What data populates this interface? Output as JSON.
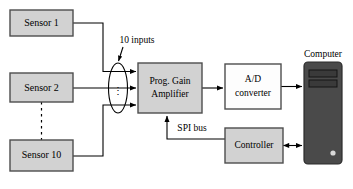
{
  "diagram": {
    "colors": {
      "box_fill_gray": "#d2d2d2",
      "box_fill_white": "#fdfdfd",
      "box_stroke": "#4d4d4d",
      "tower_fill": "#4a4a4a",
      "tower_stroke": "#2b2b2b",
      "tower_slot_fill": "#3a3a3a",
      "power_button": "#d9d9d9",
      "line": "#000000",
      "background": "#ffffff"
    },
    "nodes": {
      "sensor_1": {
        "label": "Sensor 1",
        "x": 10,
        "y": 10,
        "w": 63,
        "h": 26,
        "fill": "gray"
      },
      "sensor_2": {
        "label": "Sensor 2",
        "x": 10,
        "y": 73,
        "w": 63,
        "h": 29,
        "fill": "gray"
      },
      "sensor_10": {
        "label": "Sensor 10",
        "x": 10,
        "y": 140,
        "w": 63,
        "h": 31,
        "fill": "gray"
      },
      "amplifier": {
        "label_line1": "Prog. Gain",
        "label_line2": "Amplifier",
        "x": 138,
        "y": 63,
        "w": 64,
        "h": 50,
        "fill": "gray"
      },
      "ad_converter": {
        "label_line1": "A/D",
        "label_line2": "converter",
        "x": 225,
        "y": 64,
        "w": 56,
        "h": 45,
        "fill": "white"
      },
      "controller": {
        "label": "Controller",
        "x": 225,
        "y": 128,
        "w": 56,
        "h": 35,
        "fill": "gray"
      },
      "computer": {
        "label": "Computer",
        "x": 304,
        "y": 62,
        "w": 38,
        "h": 102,
        "fill": "tower"
      }
    },
    "annotations": {
      "inputs_label": "10 inputs",
      "spi_bus_label": "SPI bus",
      "computer_label": "Computer",
      "bus_ellipse_name": "10-input bus bundle",
      "vertical_ellipsis": "⋮"
    },
    "connections": [
      {
        "name": "sensor-1-to-bus",
        "from": "sensor_1",
        "to": "bus_ellipse",
        "arrow": true
      },
      {
        "name": "sensor-2-to-bus",
        "from": "sensor_2",
        "to": "bus_ellipse",
        "arrow": true
      },
      {
        "name": "sensor-10-to-bus",
        "from": "sensor_10",
        "to": "bus_ellipse",
        "arrow": true
      },
      {
        "name": "amplifier-to-ad-converter",
        "from": "amplifier",
        "to": "ad_converter",
        "arrow": true
      },
      {
        "name": "ad-converter-to-computer",
        "from": "ad_converter",
        "to": "computer",
        "arrow": true
      },
      {
        "name": "controller-to-computer",
        "from": "controller",
        "to": "computer",
        "arrow": "both"
      },
      {
        "name": "controller-to-amplifier-spi",
        "from": "controller",
        "to": "amplifier",
        "arrow": true
      },
      {
        "name": "sensor-2-to-sensor-10-dashed",
        "from": "sensor_2",
        "to": "sensor_10",
        "arrow": false,
        "style": "dashed"
      }
    ]
  }
}
